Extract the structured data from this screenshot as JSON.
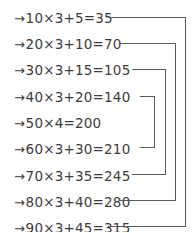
{
  "page": {
    "background_color": "#ffffff",
    "ink_color": "#3c3c3c",
    "line_color": "#5a5a5a",
    "width": 196,
    "height": 232
  },
  "arrow_glyph": "→",
  "equations": [
    {
      "index": 1,
      "arrow": "→",
      "text": "10×3+5=35",
      "y": 9,
      "text_end_x": 105,
      "bracket": 4
    },
    {
      "index": 2,
      "arrow": "→",
      "text": "20×3+10=70",
      "y": 35,
      "text_end_x": 117,
      "bracket": 3
    },
    {
      "index": 3,
      "arrow": "→",
      "text": "30×3+15=105",
      "y": 61,
      "text_end_x": 129,
      "bracket": 2
    },
    {
      "index": 4,
      "arrow": "→",
      "text": "40×3+20=140",
      "y": 88,
      "text_end_x": 137,
      "bracket": 1
    },
    {
      "index": 5,
      "arrow": "→",
      "text": "50×4=200",
      "y": 114,
      "text_end_x": 106,
      "bracket": null
    },
    {
      "index": 6,
      "arrow": "→",
      "text": "60×3+30=210",
      "y": 140,
      "text_end_x": 137,
      "bracket": 1
    },
    {
      "index": 7,
      "arrow": "→",
      "text": "70×3+35=245",
      "y": 167,
      "text_end_x": 137,
      "bracket": 2
    },
    {
      "index": 8,
      "arrow": "→",
      "text": "80×3+40=280",
      "y": 193,
      "text_end_x": 137,
      "bracket": 3
    },
    {
      "index": 9,
      "arrow": "→",
      "text": "90×3+45=315",
      "y": 219,
      "text_end_x": 129,
      "bracket": 4
    }
  ],
  "brackets": [
    {
      "level": 1,
      "pairs": [
        4,
        6
      ],
      "x": 155,
      "top_y": 96,
      "bottom_y": 148,
      "start_x": 140
    },
    {
      "level": 2,
      "pairs": [
        3,
        7
      ],
      "x": 166,
      "top_y": 69,
      "bottom_y": 175,
      "start_x": 132
    },
    {
      "level": 3,
      "pairs": [
        2,
        8
      ],
      "x": 176,
      "top_y": 43,
      "bottom_y": 201,
      "start_x": 120
    },
    {
      "level": 4,
      "pairs": [
        1,
        9
      ],
      "x": 186,
      "top_y": 17,
      "bottom_y": 227,
      "start_x": 108
    }
  ]
}
